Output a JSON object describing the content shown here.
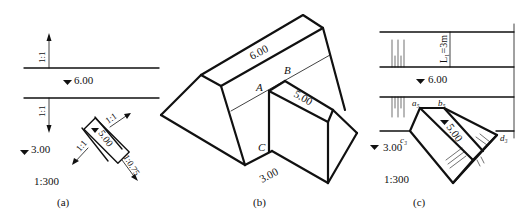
{
  "panels": {
    "a": {
      "caption": "(a)",
      "scale": "1:300",
      "elev_top": "6.00",
      "elev_low": "3.00",
      "elev_ramp": "5.00",
      "slope_up": "1:1",
      "slope_down": "1:1",
      "ramp_slope_left": "1:1",
      "ramp_slope_right": "1:1",
      "ramp_slope_end": "1:0.75"
    },
    "b": {
      "caption": "(b)",
      "elev_top": "6.00",
      "elev_ramp": "5.00",
      "elev_base": "3.00",
      "point_a": "A",
      "point_b": "B",
      "point_c": "C"
    },
    "c": {
      "caption": "(c)",
      "scale": "1:300",
      "elev_top": "6.00",
      "elev_ramp": "5.00",
      "elev_low": "3.00",
      "dim_l1": "L₁=3m",
      "pt_a5": "a₅",
      "pt_b5": "b₅",
      "pt_c3": "c₃",
      "pt_d3": "d₃"
    }
  }
}
